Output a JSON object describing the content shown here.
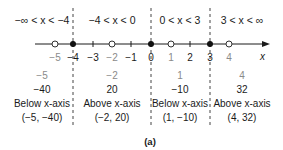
{
  "intervals": [
    {
      "label": "−∞ < x < −4",
      "test_x": "−5",
      "value": "−40",
      "position": "Below x-axis",
      "point": "(−5, −40)"
    },
    {
      "label": "−4 < x < 0",
      "test_x": "−2",
      "value": "20",
      "position": "Above x-axis",
      "point": "(−2, 20)"
    },
    {
      "label": "0 < x < 3",
      "test_x": "1",
      "value": "−10",
      "position": "Below x-axis",
      "point": "(1, −10)"
    },
    {
      "label": "3 < x < ∞",
      "test_x": "4",
      "value": "32",
      "position": "Above x-axis",
      "point": "(4, 32)"
    }
  ],
  "number_line": {
    "axis_label": "x",
    "ticks": [
      "−5",
      "−4",
      "−3",
      "−2",
      "−1",
      "0",
      "1",
      "2",
      "3",
      "4"
    ],
    "zeros": [
      "−4",
      "0",
      "3"
    ],
    "test_points": [
      "−5",
      "−2",
      "1",
      "4"
    ]
  },
  "caption": "(a)",
  "colors": {
    "line": "#1a1a1a",
    "gray_label": "#8a8a8a"
  }
}
